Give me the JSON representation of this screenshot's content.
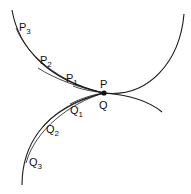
{
  "diagram": {
    "title": "",
    "point": {
      "label_top": "P",
      "label_bottom": "Q"
    },
    "upper_points": [
      {
        "base": "P",
        "sub": "1"
      },
      {
        "base": "P",
        "sub": "2"
      },
      {
        "base": "P",
        "sub": "3"
      }
    ],
    "lower_points": [
      {
        "base": "Q",
        "sub": "1"
      },
      {
        "base": "Q",
        "sub": "2"
      },
      {
        "base": "Q",
        "sub": "3"
      }
    ],
    "colors": {
      "stroke": "#1a1a1a",
      "background": "#ffffff"
    }
  }
}
